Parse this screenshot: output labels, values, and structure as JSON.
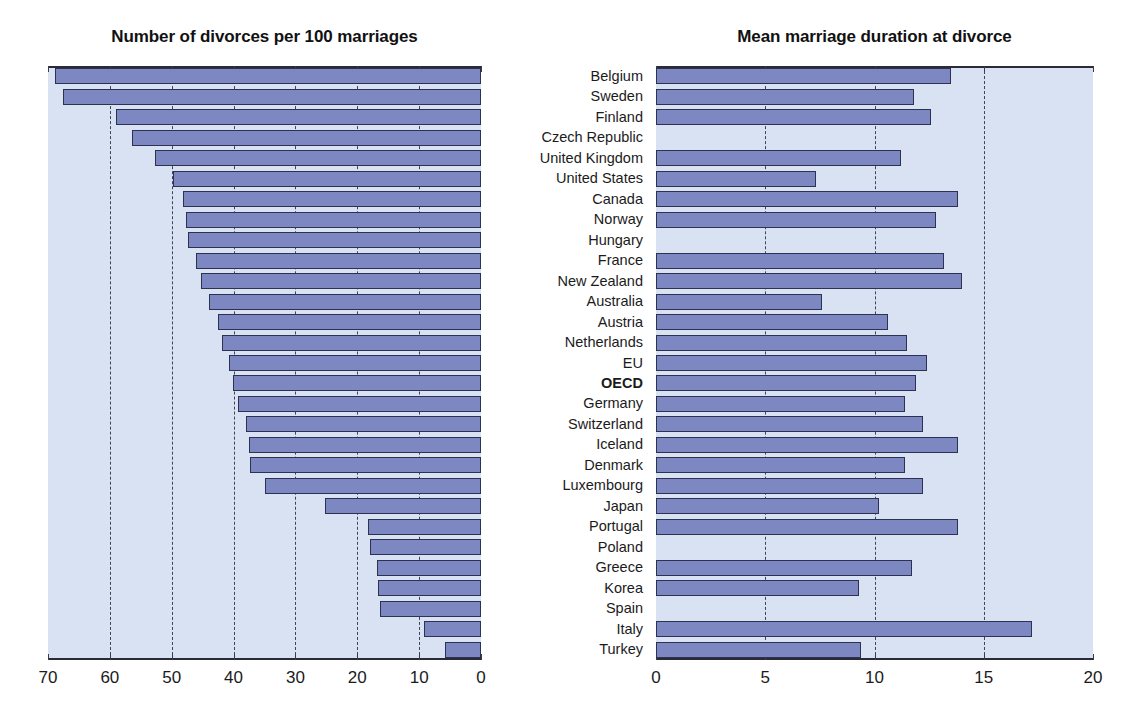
{
  "charts": {
    "left": {
      "title": "Number of divorces per 100 marriages",
      "axis_ticks": [
        "70",
        "60",
        "50",
        "40",
        "30",
        "20",
        "10",
        "0"
      ],
      "axis_min": 0,
      "axis_max": 70,
      "reversed": true
    },
    "right": {
      "title": "Mean marriage duration at divorce",
      "axis_ticks": [
        "0",
        "5",
        "10",
        "15",
        "20"
      ],
      "axis_min": 0,
      "axis_max": 20,
      "reversed": false
    }
  },
  "categories": [
    "Belgium",
    "Sweden",
    "Finland",
    "Czech Republic",
    "United Kingdom",
    "United States",
    "Canada",
    "Norway",
    "Hungary",
    "France",
    "New Zealand",
    "Australia",
    "Austria",
    "Netherlands",
    "EU",
    "OECD",
    "Germany",
    "Switzerland",
    "Iceland",
    "Denmark",
    "Luxembourg",
    "Japan",
    "Portugal",
    "Poland",
    "Greece",
    "Korea",
    "Spain",
    "Italy",
    "Turkey"
  ],
  "highlight_category": "OECD",
  "colors": {
    "bar_fill": "#7d87c2",
    "bar_border": "#2d3250",
    "panel_background": "#d9e2f2",
    "axis": "#2b2b38",
    "gridline": "#3d4455",
    "text": "#1b1b1b"
  },
  "chart_data": [
    {
      "type": "bar",
      "orientation": "horizontal",
      "title": "Number of divorces per 100 marriages",
      "xlabel": "",
      "ylabel": "",
      "xlim": [
        0,
        70
      ],
      "x_reversed": true,
      "grid": true,
      "legend": "none",
      "categories": [
        "Belgium",
        "Sweden",
        "Finland",
        "Czech Republic",
        "United Kingdom",
        "United States",
        "Canada",
        "Norway",
        "Hungary",
        "France",
        "New Zealand",
        "Australia",
        "Austria",
        "Netherlands",
        "EU",
        "OECD",
        "Germany",
        "Switzerland",
        "Iceland",
        "Denmark",
        "Luxembourg",
        "Japan",
        "Portugal",
        "Poland",
        "Greece",
        "Korea",
        "Spain",
        "Italy",
        "Turkey"
      ],
      "values": [
        68.9,
        67.6,
        59.0,
        56.4,
        52.7,
        49.8,
        48.2,
        47.7,
        47.3,
        46.0,
        45.3,
        44.0,
        42.6,
        41.8,
        40.7,
        40.1,
        39.3,
        38.0,
        37.5,
        37.3,
        35.0,
        25.2,
        18.2,
        17.9,
        16.8,
        16.6,
        16.3,
        9.2,
        5.8
      ]
    },
    {
      "type": "bar",
      "orientation": "horizontal",
      "title": "Mean marriage duration at divorce",
      "xlabel": "",
      "ylabel": "",
      "xlim": [
        0,
        20
      ],
      "x_reversed": false,
      "grid": true,
      "legend": "none",
      "categories": [
        "Belgium",
        "Sweden",
        "Finland",
        "Czech Republic",
        "United Kingdom",
        "United States",
        "Canada",
        "Norway",
        "Hungary",
        "France",
        "New Zealand",
        "Australia",
        "Austria",
        "Netherlands",
        "EU",
        "OECD",
        "Germany",
        "Switzerland",
        "Iceland",
        "Denmark",
        "Luxembourg",
        "Japan",
        "Portugal",
        "Poland",
        "Greece",
        "Korea",
        "Spain",
        "Italy",
        "Turkey"
      ],
      "values": [
        13.5,
        11.8,
        12.6,
        null,
        11.2,
        7.3,
        13.8,
        12.8,
        null,
        13.2,
        14.0,
        7.6,
        10.6,
        11.5,
        12.4,
        11.9,
        11.4,
        12.2,
        13.8,
        11.4,
        12.2,
        10.2,
        13.8,
        null,
        11.7,
        9.3,
        null,
        17.2,
        9.4
      ]
    }
  ]
}
